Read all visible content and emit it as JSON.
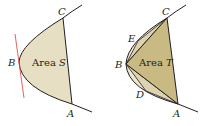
{
  "colors": {
    "fill_light": "#e6dfc4",
    "fill_mid": "#ddd3b0",
    "fill_dark": "#c9b983",
    "curve": "#231f20",
    "tangent": "#d9534f",
    "background": "#ffffff"
  },
  "left_figure": {
    "points": {
      "C": {
        "label": "C",
        "x": 63,
        "y": 18
      },
      "B": {
        "label": "B",
        "x": 19,
        "y": 62
      },
      "A": {
        "label": "A",
        "x": 72,
        "y": 104
      }
    },
    "area_label": "Area",
    "area_var": "S",
    "tangent_at": "B"
  },
  "right_figure": {
    "points": {
      "C": {
        "label": "C",
        "x": 167,
        "y": 18
      },
      "E": {
        "label": "E",
        "x": 138,
        "y": 41
      },
      "B": {
        "label": "B",
        "x": 126,
        "y": 64
      },
      "D": {
        "label": "D",
        "x": 146,
        "y": 91
      },
      "A": {
        "label": "A",
        "x": 178,
        "y": 104
      }
    },
    "area_label": "Area",
    "area_var": "T"
  }
}
